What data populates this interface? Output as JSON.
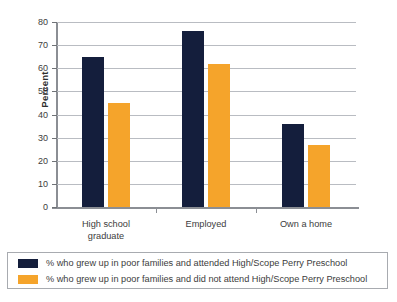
{
  "chart_data": {
    "type": "bar",
    "title": "",
    "xlabel": "",
    "ylabel": "Percent",
    "ylim": [
      0,
      80
    ],
    "yticks": [
      0,
      10,
      20,
      30,
      40,
      50,
      60,
      70,
      80
    ],
    "grid": true,
    "legend_position": "bottom",
    "categories": [
      "High school graduate",
      "Employed",
      "Own a home"
    ],
    "category_lines": [
      [
        "High school",
        "graduate"
      ],
      [
        "Employed"
      ],
      [
        "Own a home"
      ]
    ],
    "series": [
      {
        "name": "% who grew up in poor families and attended High/Scope Perry Preschool",
        "color": "#141E3C",
        "values": [
          65,
          76,
          36
        ]
      },
      {
        "name": "% who grew up in poor families and did not attend High/Scope Perry Preschool",
        "color": "#F5A42B",
        "values": [
          45,
          62,
          27
        ]
      }
    ]
  },
  "axis": {
    "y_title": "Percent",
    "tick_labels": [
      "0",
      "10",
      "20",
      "30",
      "40",
      "50",
      "60",
      "70",
      "80"
    ]
  },
  "legend": {
    "entries": [
      {
        "swatch_color": "#141E3C",
        "label": "% who grew up in poor families and attended High/Scope Perry Preschool"
      },
      {
        "swatch_color": "#F5A42B",
        "label": "% who grew up in poor families and did not attend High/Scope Perry Preschool"
      }
    ]
  },
  "colors": {
    "series_attended": "#141E3C",
    "series_not_attended": "#F5A42B",
    "gridline": "#b9bcc2",
    "axis": "#8b8e94",
    "text": "#3c3c3c"
  }
}
